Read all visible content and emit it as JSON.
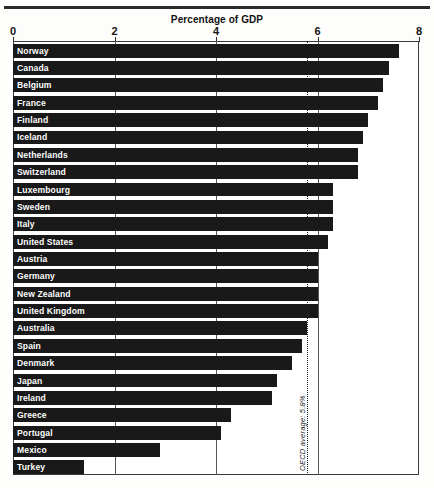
{
  "chart_data": {
    "type": "bar",
    "orientation": "horizontal",
    "title": "Percentage of GDP",
    "xlabel": "",
    "ylabel": "",
    "xlim": [
      0,
      8
    ],
    "xticks": [
      0,
      2,
      4,
      6,
      8
    ],
    "xtick_labels": [
      "0",
      "2",
      "4",
      "6",
      "8"
    ],
    "grid": true,
    "legend": false,
    "categories": [
      "Norway",
      "Canada",
      "Belgium",
      "France",
      "Finland",
      "Iceland",
      "Netherlands",
      "Switzerland",
      "Luxembourg",
      "Sweden",
      "Italy",
      "United States",
      "Austria",
      "Germany",
      "New Zealand",
      "United Kingdom",
      "Australia",
      "Spain",
      "Denmark",
      "Japan",
      "Ireland",
      "Greece",
      "Portugal",
      "Mexico",
      "Turkey"
    ],
    "values": [
      7.6,
      7.4,
      7.3,
      7.2,
      7.0,
      6.9,
      6.8,
      6.8,
      6.3,
      6.3,
      6.3,
      6.2,
      6.0,
      6.0,
      6.0,
      6.0,
      5.8,
      5.7,
      5.5,
      5.2,
      5.1,
      4.3,
      4.1,
      2.9,
      1.4
    ],
    "annotations": [
      {
        "name": "oecd-average",
        "label": "OECD average: 5.8%",
        "value": 5.8,
        "style": "dotted-vertical-line"
      }
    ],
    "bar_color": "#191919",
    "label_color": "#ffffff",
    "background_color": "#ffffff"
  }
}
